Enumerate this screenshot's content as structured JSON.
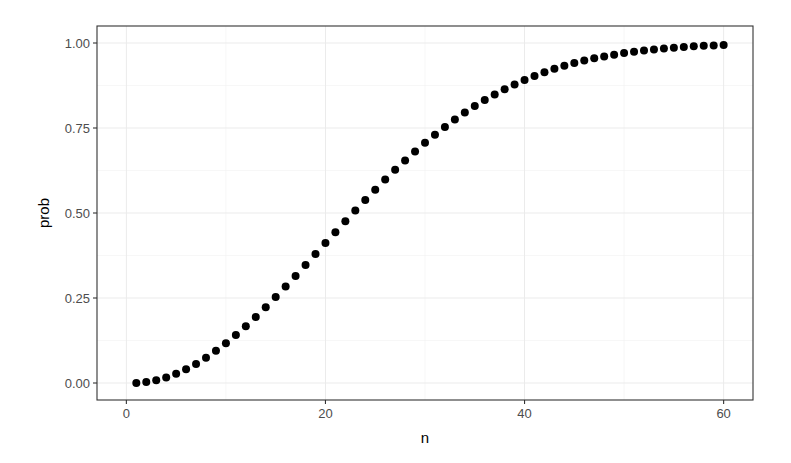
{
  "chart_data": {
    "type": "scatter",
    "title": "",
    "xlabel": "n",
    "ylabel": "prob",
    "xlim": [
      -2.95,
      62.95
    ],
    "ylim": [
      -0.05,
      1.05
    ],
    "x_ticks": [
      0,
      20,
      40,
      60
    ],
    "x_tick_labels": [
      "0",
      "20",
      "40",
      "60"
    ],
    "y_ticks": [
      0,
      0.25,
      0.5,
      0.75,
      1.0
    ],
    "y_tick_labels": [
      "0.00",
      "0.25",
      "0.50",
      "0.75",
      "1.00"
    ],
    "grid": true,
    "legend": null,
    "point_color": "#000000",
    "x": [
      1,
      2,
      3,
      4,
      5,
      6,
      7,
      8,
      9,
      10,
      11,
      12,
      13,
      14,
      15,
      16,
      17,
      18,
      19,
      20,
      21,
      22,
      23,
      24,
      25,
      26,
      27,
      28,
      29,
      30,
      31,
      32,
      33,
      34,
      35,
      36,
      37,
      38,
      39,
      40,
      41,
      42,
      43,
      44,
      45,
      46,
      47,
      48,
      49,
      50,
      51,
      52,
      53,
      54,
      55,
      56,
      57,
      58,
      59,
      60
    ],
    "y": [
      0,
      0.0027,
      0.0082,
      0.0164,
      0.0271,
      0.0405,
      0.0562,
      0.0743,
      0.0946,
      0.1169,
      0.1411,
      0.167,
      0.1944,
      0.2231,
      0.2529,
      0.2836,
      0.315,
      0.3469,
      0.3791,
      0.4114,
      0.4437,
      0.4757,
      0.5073,
      0.5383,
      0.5687,
      0.5982,
      0.6269,
      0.6545,
      0.681,
      0.7063,
      0.7305,
      0.7533,
      0.775,
      0.7953,
      0.8144,
      0.8322,
      0.8487,
      0.8641,
      0.8782,
      0.8912,
      0.9032,
      0.914,
      0.9239,
      0.9329,
      0.941,
      0.9483,
      0.9548,
      0.9606,
      0.9658,
      0.9704,
      0.9744,
      0.978,
      0.9811,
      0.9839,
      0.9863,
      0.9883,
      0.9901,
      0.9917,
      0.993,
      0.9941
    ]
  }
}
